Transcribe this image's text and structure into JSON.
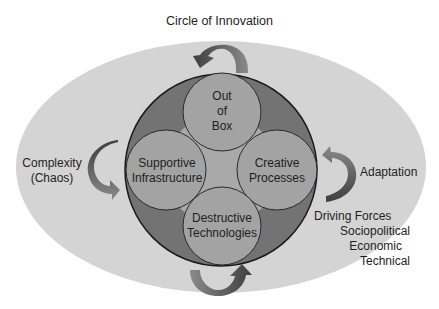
{
  "diagram": {
    "title": "Circle of Innovation",
    "outer_ellipse": {
      "fill": "#d4d4d4"
    },
    "main_circle": {
      "fill": "#737373",
      "stroke": "#1a1a1a"
    },
    "center_fill": "#a9a9a9",
    "inner_circles": [
      {
        "id": "out-of-box",
        "lines": [
          "Out",
          "of",
          "Box"
        ],
        "fill": "#a3a3a3"
      },
      {
        "id": "supportive-infrastructure",
        "lines": [
          "Supportive",
          "Infrastructure"
        ],
        "fill": "#a3a3a3"
      },
      {
        "id": "creative-processes",
        "lines": [
          "Creative",
          "Processes"
        ],
        "fill": "#a3a3a3"
      },
      {
        "id": "destructive-technologies",
        "lines": [
          "Destructive",
          "Technologies"
        ],
        "fill": "#a3a3a3"
      }
    ],
    "external_labels": {
      "complexity": [
        "Complexity",
        "(Chaos)"
      ],
      "adaptation": "Adaptation",
      "driving_forces": [
        "Driving Forces",
        "Sociopolitical",
        "Economic",
        "Technical"
      ]
    },
    "arrows": [
      {
        "position": "top",
        "direction": "counterclockwise"
      },
      {
        "position": "left",
        "direction": "down-right"
      },
      {
        "position": "right",
        "direction": "up-left"
      },
      {
        "position": "bottom",
        "direction": "up-right"
      }
    ],
    "arrow_colors": {
      "dark": "#4a4a4a",
      "light": "#8a8a8a"
    }
  }
}
